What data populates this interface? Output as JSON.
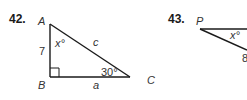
{
  "problems": [
    {
      "number": "42.",
      "vertices": {
        "A": "A",
        "B": "B",
        "C": "C"
      },
      "side_left": "7",
      "side_hyp": "c",
      "side_bottom": "a",
      "angle_A": "x°",
      "angle_C": "30°",
      "right_angle_at": "B"
    },
    {
      "number": "43.",
      "vertices": {
        "P": "P"
      },
      "angle_P": "x°",
      "side_partial": "8"
    }
  ],
  "colors": {
    "line": "#1a1a1a",
    "text": "#333333"
  }
}
